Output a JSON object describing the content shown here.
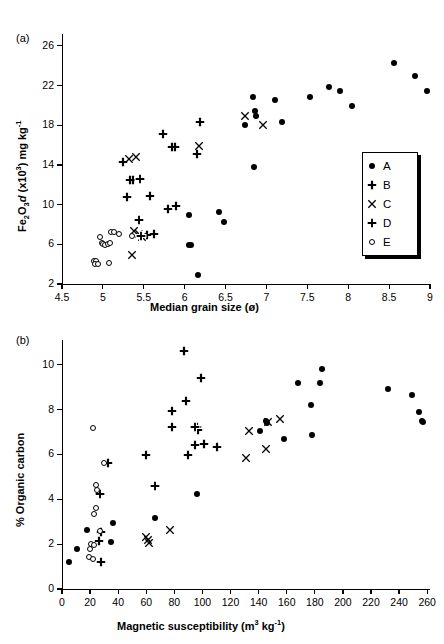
{
  "figure": {
    "panel_a_label": "(a)",
    "panel_b_label": "(b)"
  },
  "legend": {
    "position": "inside-bottom-right-panel-a",
    "entries": [
      {
        "label": "A",
        "marker": "filled-circle-icon"
      },
      {
        "label": "B",
        "marker": "thin-cross-icon"
      },
      {
        "label": "C",
        "marker": "x-cross-icon"
      },
      {
        "label": "D",
        "marker": "bold-outlined-cross-icon"
      },
      {
        "label": "E",
        "marker": "open-circle-icon"
      }
    ]
  },
  "chart_data": [
    {
      "id": "panel-a",
      "type": "scatter",
      "title": "(a)",
      "xlabel": "Median grain size (ø)",
      "ylabel": "Fe2O3d (x10³) mg kg⁻¹",
      "ylabel_parts": {
        "fe": "Fe",
        "two": "2",
        "o": "O",
        "three": "3",
        "d": "d",
        "mult": " (x10",
        "exp3": "3",
        "units": ") mg kg",
        "expm1": "-1"
      },
      "xlim": [
        4.5,
        9.0
      ],
      "ylim": [
        2,
        27.2
      ],
      "xticks": [
        4.5,
        5,
        5.5,
        6,
        6.5,
        7,
        7.5,
        8,
        8.5,
        9
      ],
      "xtick_labels": [
        "4.5",
        "5",
        "5.5",
        "6",
        "6.5",
        "7",
        "7.5",
        "8",
        "8.5",
        "9"
      ],
      "yticks": [
        2,
        6,
        10,
        14,
        18,
        22,
        26
      ],
      "ytick_labels": [
        "2",
        "6",
        "10",
        "14",
        "18",
        "22",
        "26"
      ],
      "grid": false,
      "series": [
        {
          "name": "A",
          "marker": "filled-circle-icon",
          "points": [
            [
              6.16,
              2.9
            ],
            [
              6.05,
              5.95
            ],
            [
              6.08,
              5.95
            ],
            [
              6.05,
              9.0
            ],
            [
              6.42,
              9.3
            ],
            [
              6.48,
              8.3
            ],
            [
              6.85,
              13.8
            ],
            [
              6.74,
              18.0
            ],
            [
              6.86,
              19.4
            ],
            [
              6.87,
              18.9
            ],
            [
              6.84,
              20.8
            ],
            [
              7.11,
              20.5
            ],
            [
              7.19,
              18.3
            ],
            [
              7.53,
              20.9
            ],
            [
              7.76,
              21.9
            ],
            [
              7.9,
              21.5
            ],
            [
              8.05,
              19.9
            ],
            [
              8.56,
              24.3
            ],
            [
              8.82,
              23.0
            ],
            [
              8.96,
              21.5
            ]
          ]
        },
        {
          "name": "B",
          "marker": "thin-cross-icon",
          "points": [
            [
              5.24,
              14.3
            ],
            [
              5.33,
              12.5
            ],
            [
              5.37,
              12.5
            ],
            [
              5.3,
              10.8
            ],
            [
              5.45,
              12.6
            ],
            [
              5.58,
              10.9
            ],
            [
              5.73,
              17.1
            ],
            [
              5.84,
              15.8
            ],
            [
              5.88,
              15.8
            ],
            [
              5.8,
              9.6
            ],
            [
              5.9,
              9.9
            ],
            [
              6.19,
              18.3
            ],
            [
              6.15,
              15.1
            ],
            [
              5.62,
              7.0
            ],
            [
              5.54,
              6.9
            ]
          ]
        },
        {
          "name": "C",
          "marker": "x-cross-icon",
          "points": [
            [
              5.32,
              14.6
            ],
            [
              5.41,
              14.8
            ],
            [
              6.17,
              15.9
            ],
            [
              6.74,
              18.9
            ],
            [
              6.96,
              18.0
            ],
            [
              5.38,
              7.3
            ],
            [
              5.44,
              7.0
            ],
            [
              5.48,
              6.7
            ],
            [
              5.35,
              4.9
            ]
          ]
        },
        {
          "name": "D",
          "marker": "bold-outlined-cross-icon",
          "points": [
            [
              5.45,
              12.6
            ],
            [
              5.44,
              8.5
            ],
            [
              5.46,
              6.8
            ]
          ]
        },
        {
          "name": "E",
          "marker": "open-circle-icon",
          "points": [
            [
              4.89,
              4.3
            ],
            [
              4.92,
              4.3
            ],
            [
              4.9,
              4.05
            ],
            [
              4.94,
              4.05
            ],
            [
              5.07,
              4.1
            ],
            [
              4.97,
              6.7
            ],
            [
              4.99,
              6.1
            ],
            [
              5.0,
              6.0
            ],
            [
              5.03,
              5.9
            ],
            [
              5.06,
              6.05
            ],
            [
              5.09,
              6.1
            ],
            [
              5.1,
              7.2
            ],
            [
              5.14,
              7.2
            ],
            [
              5.2,
              7.0
            ],
            [
              5.35,
              6.8
            ]
          ]
        }
      ]
    },
    {
      "id": "panel-b",
      "type": "scatter",
      "title": "(b)",
      "xlabel": "Magnetic susceptibility (m³ kg⁻¹)",
      "xlabel_parts": {
        "main": "Magnetic susceptibility (m",
        "exp3": "3",
        "mid": " kg",
        "expm1": "-1",
        "end": ")"
      },
      "ylabel": "% Organic carbon",
      "xlim": [
        0,
        262
      ],
      "ylim": [
        0,
        11.1
      ],
      "xticks": [
        0,
        20,
        40,
        60,
        80,
        100,
        120,
        140,
        160,
        180,
        200,
        220,
        240,
        260
      ],
      "xtick_labels": [
        "0",
        "20",
        "40",
        "60",
        "80",
        "100",
        "120",
        "140",
        "160",
        "180",
        "200",
        "220",
        "240",
        "260"
      ],
      "yticks": [
        0,
        2,
        4,
        6,
        8,
        10
      ],
      "ytick_labels": [
        "0",
        "2",
        "4",
        "6",
        "8",
        "10"
      ],
      "grid": false,
      "series": [
        {
          "name": "A",
          "marker": "filled-circle-icon",
          "points": [
            [
              5,
              1.22
            ],
            [
              11,
              1.78
            ],
            [
              18,
              2.63
            ],
            [
              36,
              2.93
            ],
            [
              35,
              2.08
            ],
            [
              66,
              3.18
            ],
            [
              96,
              4.22
            ],
            [
              141,
              7.05
            ],
            [
              145,
              7.5
            ],
            [
              146,
              7.4
            ],
            [
              158,
              6.7
            ],
            [
              168,
              9.18
            ],
            [
              177,
              8.2
            ],
            [
              178,
              6.85
            ],
            [
              184,
              9.18
            ],
            [
              185,
              9.8
            ],
            [
              232,
              8.9
            ],
            [
              249,
              8.65
            ],
            [
              254,
              7.88
            ],
            [
              256,
              7.5
            ],
            [
              257,
              7.45
            ]
          ]
        },
        {
          "name": "B",
          "marker": "thin-cross-icon",
          "points": [
            [
              28,
              1.22
            ],
            [
              26,
              2.12
            ],
            [
              28,
              2.55
            ],
            [
              33,
              5.62
            ],
            [
              60,
              5.98
            ],
            [
              78,
              7.95
            ],
            [
              78,
              7.2
            ],
            [
              87,
              10.6
            ],
            [
              88,
              8.38
            ],
            [
              90,
              5.98
            ],
            [
              96,
              7.22
            ],
            [
              97,
              7.1
            ],
            [
              99,
              9.4
            ],
            [
              101,
              6.45
            ],
            [
              110,
              6.35
            ],
            [
              95,
              6.4
            ]
          ]
        },
        {
          "name": "C",
          "marker": "x-cross-icon",
          "points": [
            [
              60,
              2.3
            ],
            [
              61,
              2.18
            ],
            [
              62,
              2.05
            ],
            [
              77,
              2.65
            ],
            [
              131,
              5.82
            ],
            [
              133,
              7.05
            ],
            [
              145,
              6.25
            ],
            [
              147,
              7.45
            ],
            [
              155,
              7.6
            ]
          ]
        },
        {
          "name": "D",
          "marker": "bold-outlined-cross-icon",
          "points": [
            [
              27,
              4.25
            ],
            [
              66,
              4.58
            ],
            [
              95,
              7.2
            ]
          ]
        },
        {
          "name": "E",
          "marker": "open-circle-icon",
          "points": [
            [
              19,
              1.42
            ],
            [
              20,
              1.8
            ],
            [
              21,
              2.02
            ],
            [
              23,
              1.95
            ],
            [
              23,
              3.35
            ],
            [
              24,
              3.6
            ],
            [
              22,
              7.18
            ],
            [
              24,
              4.65
            ],
            [
              25,
              4.42
            ],
            [
              27,
              2.6
            ],
            [
              30,
              5.6
            ],
            [
              22,
              1.35
            ]
          ]
        }
      ]
    }
  ]
}
